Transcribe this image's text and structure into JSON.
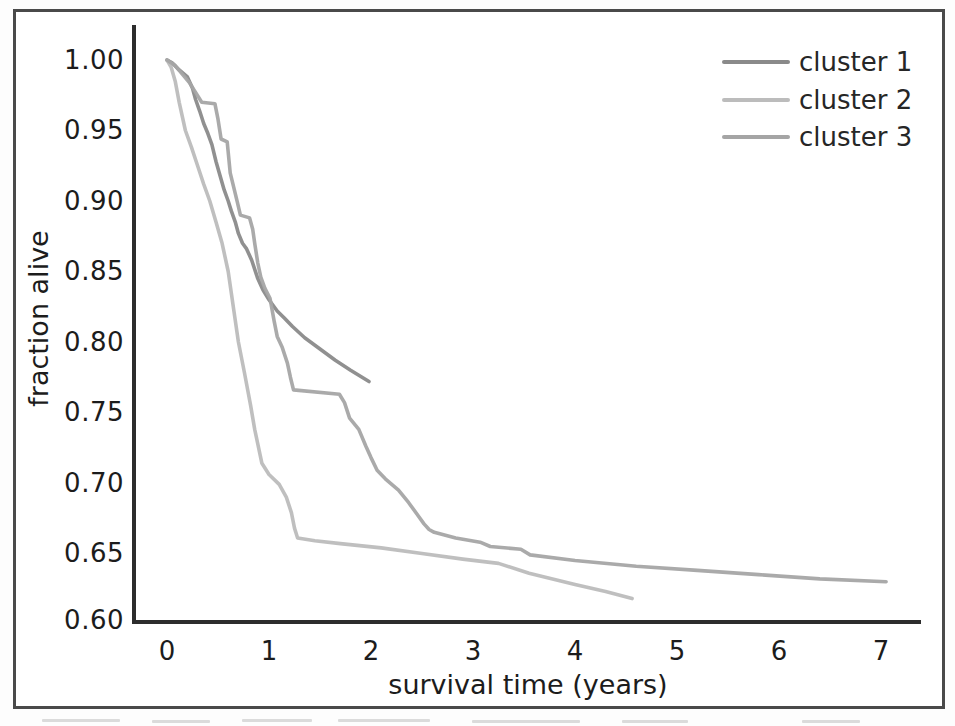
{
  "figure": {
    "kind": "scanned survival-analysis figure",
    "border_color": "#4a4a4a",
    "background": "#ffffff"
  },
  "chart_data": {
    "type": "line",
    "subtype": "kaplan-meier-survival-curves",
    "title": "",
    "xlabel": "survival time (years)",
    "ylabel": "fraction alive",
    "xlim": [
      -0.35,
      7.4
    ],
    "ylim": [
      0.6,
      1.025
    ],
    "grid": false,
    "legend_position": "upper right",
    "xtick_labels": [
      "0",
      "1",
      "2",
      "3",
      "4",
      "5",
      "6",
      "7"
    ],
    "ytick_labels": [
      "1.00",
      "0.95",
      "0.90",
      "0.85",
      "0.80",
      "0.75",
      "0.70",
      "0.65",
      "0.60"
    ],
    "axis_color": "#2d2d2d",
    "series": [
      {
        "name": "cluster 1",
        "color": "#8a8a8a",
        "points": [
          [
            0,
            1.0
          ],
          [
            0.05,
            0.998
          ],
          [
            0.12,
            0.993
          ],
          [
            0.2,
            0.988
          ],
          [
            0.25,
            0.98
          ],
          [
            0.28,
            0.972
          ],
          [
            0.32,
            0.964
          ],
          [
            0.36,
            0.955
          ],
          [
            0.4,
            0.948
          ],
          [
            0.44,
            0.94
          ],
          [
            0.48,
            0.928
          ],
          [
            0.52,
            0.918
          ],
          [
            0.56,
            0.908
          ],
          [
            0.6,
            0.9
          ],
          [
            0.63,
            0.893
          ],
          [
            0.67,
            0.885
          ],
          [
            0.7,
            0.877
          ],
          [
            0.74,
            0.87
          ],
          [
            0.78,
            0.866
          ],
          [
            0.83,
            0.858
          ],
          [
            0.89,
            0.845
          ],
          [
            0.94,
            0.837
          ],
          [
            1.0,
            0.83
          ],
          [
            1.08,
            0.822
          ],
          [
            1.15,
            0.817
          ],
          [
            1.23,
            0.811
          ],
          [
            1.35,
            0.803
          ],
          [
            1.5,
            0.795
          ],
          [
            1.65,
            0.787
          ],
          [
            1.8,
            0.78
          ],
          [
            1.98,
            0.772
          ]
        ]
      },
      {
        "name": "cluster 2",
        "color": "#bcbcbc",
        "points": [
          [
            0,
            1.0
          ],
          [
            0.04,
            0.995
          ],
          [
            0.08,
            0.985
          ],
          [
            0.12,
            0.97
          ],
          [
            0.18,
            0.95
          ],
          [
            0.24,
            0.938
          ],
          [
            0.3,
            0.925
          ],
          [
            0.36,
            0.912
          ],
          [
            0.42,
            0.9
          ],
          [
            0.48,
            0.885
          ],
          [
            0.54,
            0.87
          ],
          [
            0.6,
            0.85
          ],
          [
            0.65,
            0.825
          ],
          [
            0.7,
            0.8
          ],
          [
            0.76,
            0.778
          ],
          [
            0.82,
            0.755
          ],
          [
            0.86,
            0.738
          ],
          [
            0.93,
            0.714
          ],
          [
            1.0,
            0.706
          ],
          [
            1.1,
            0.699
          ],
          [
            1.17,
            0.69
          ],
          [
            1.22,
            0.679
          ],
          [
            1.25,
            0.668
          ],
          [
            1.28,
            0.661
          ],
          [
            1.45,
            0.659
          ],
          [
            1.7,
            0.657
          ],
          [
            2.1,
            0.654
          ],
          [
            2.5,
            0.65
          ],
          [
            2.9,
            0.646
          ],
          [
            3.25,
            0.643
          ],
          [
            3.55,
            0.636
          ],
          [
            4.0,
            0.628
          ],
          [
            4.3,
            0.623
          ],
          [
            4.56,
            0.618
          ]
        ]
      },
      {
        "name": "cluster 3",
        "color": "#a5a5a5",
        "points": [
          [
            0,
            1.0
          ],
          [
            0.08,
            0.996
          ],
          [
            0.15,
            0.99
          ],
          [
            0.22,
            0.984
          ],
          [
            0.28,
            0.977
          ],
          [
            0.34,
            0.97
          ],
          [
            0.47,
            0.969
          ],
          [
            0.5,
            0.958
          ],
          [
            0.53,
            0.944
          ],
          [
            0.59,
            0.942
          ],
          [
            0.62,
            0.92
          ],
          [
            0.66,
            0.908
          ],
          [
            0.69,
            0.899
          ],
          [
            0.72,
            0.89
          ],
          [
            0.81,
            0.888
          ],
          [
            0.84,
            0.88
          ],
          [
            0.86,
            0.87
          ],
          [
            0.89,
            0.856
          ],
          [
            0.92,
            0.846
          ],
          [
            0.96,
            0.838
          ],
          [
            1.01,
            0.831
          ],
          [
            1.05,
            0.815
          ],
          [
            1.08,
            0.804
          ],
          [
            1.13,
            0.796
          ],
          [
            1.18,
            0.785
          ],
          [
            1.21,
            0.775
          ],
          [
            1.24,
            0.766
          ],
          [
            1.69,
            0.763
          ],
          [
            1.74,
            0.757
          ],
          [
            1.79,
            0.746
          ],
          [
            1.88,
            0.738
          ],
          [
            1.95,
            0.726
          ],
          [
            2.0,
            0.718
          ],
          [
            2.06,
            0.709
          ],
          [
            2.14,
            0.703
          ],
          [
            2.27,
            0.695
          ],
          [
            2.37,
            0.686
          ],
          [
            2.45,
            0.678
          ],
          [
            2.52,
            0.671
          ],
          [
            2.57,
            0.667
          ],
          [
            2.62,
            0.665
          ],
          [
            2.83,
            0.661
          ],
          [
            3.07,
            0.658
          ],
          [
            3.17,
            0.655
          ],
          [
            3.47,
            0.653
          ],
          [
            3.56,
            0.649
          ],
          [
            4.0,
            0.645
          ],
          [
            4.6,
            0.641
          ],
          [
            5.2,
            0.638
          ],
          [
            5.8,
            0.635
          ],
          [
            6.4,
            0.632
          ],
          [
            7.05,
            0.63
          ]
        ]
      }
    ]
  }
}
